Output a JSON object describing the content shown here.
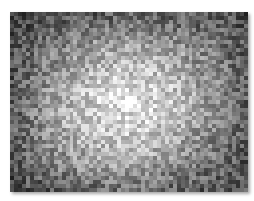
{
  "image": {
    "description": "Noisy grayscale astronomical-style image with diffuse bright glow and compact bright core",
    "frame": {
      "x": 10,
      "y": 12,
      "width": 238,
      "height": 180
    },
    "grid": {
      "cols": 60,
      "rows": 45
    },
    "seed": 1337,
    "background_level": 70,
    "noise_amplitude": 95,
    "glow": {
      "center_x": 0.49,
      "center_y": 0.52,
      "radius_x": 0.55,
      "radius_y": 0.62,
      "peak": 150,
      "angle_deg": -20
    },
    "core": {
      "x": 0.5,
      "y": 0.5,
      "radius_px": 7,
      "level": 255
    },
    "secondary_blob": {
      "x": 0.42,
      "y": 0.58,
      "radius_px": 9,
      "level": 225
    },
    "vignette": {
      "top_left": 0.75,
      "bottom_left": 0.8,
      "top_right": 0.85,
      "bottom_right": 0.9
    }
  }
}
